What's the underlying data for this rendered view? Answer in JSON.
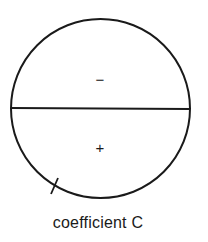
{
  "diagram": {
    "caption": "coefficient C",
    "upper_region_sign": "−",
    "lower_region_sign": "+",
    "stroke_color": "#1a1a1a"
  }
}
